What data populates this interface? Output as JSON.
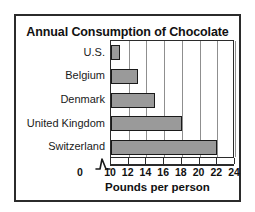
{
  "chart_data": {
    "type": "bar",
    "orientation": "horizontal",
    "title": "Annual Consumption of Chocolate",
    "xlabel": "Pounds per person",
    "ylabel": "",
    "categories": [
      "U.S.",
      "Belgium",
      "Denmark",
      "United Kingdom",
      "Switzerland"
    ],
    "values": [
      11,
      13,
      15,
      18,
      22
    ],
    "xlim": [
      10,
      24
    ],
    "xticks": [
      0,
      10,
      12,
      14,
      16,
      18,
      20,
      22,
      24
    ],
    "xtick_labels": [
      "0",
      "10",
      "12",
      "14",
      "16",
      "18",
      "20",
      "22",
      "24"
    ],
    "axis_break": true,
    "axis_break_between": [
      0,
      10
    ],
    "grid": "vertical",
    "legend": "none",
    "bar_fill_color": "#9a9a9a",
    "bar_edge_color": "#1a1a1a",
    "gridline_color": "#8f8f8f",
    "frame_color": "#2b2b2b",
    "background_color": "#ffffff"
  }
}
